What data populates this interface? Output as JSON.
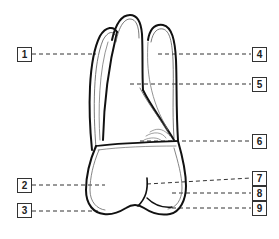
{
  "diagram": {
    "stroke_color": "#111111",
    "leader_color": "#333333",
    "labels": [
      {
        "num": "1",
        "x": 17,
        "y": 47
      },
      {
        "num": "2",
        "x": 17,
        "y": 178
      },
      {
        "num": "3",
        "x": 17,
        "y": 203
      },
      {
        "num": "4",
        "x": 252,
        "y": 47
      },
      {
        "num": "5",
        "x": 252,
        "y": 77
      },
      {
        "num": "6",
        "x": 252,
        "y": 134
      },
      {
        "num": "7",
        "x": 252,
        "y": 171
      },
      {
        "num": "8",
        "x": 252,
        "y": 186
      },
      {
        "num": "9",
        "x": 252,
        "y": 201
      }
    ]
  }
}
